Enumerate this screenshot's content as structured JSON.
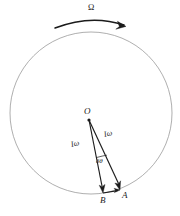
{
  "figure": {
    "background_color": "#ffffff",
    "stroke_color": "#1b1b1b",
    "circle_color": "#9a9a9a",
    "labels": {
      "spin_rate": "Ω",
      "center_point": "O",
      "vector_left": "Iω",
      "vector_right": "Iω",
      "angle": "δθ",
      "point_b": "B",
      "point_a": "A"
    },
    "geometry": {
      "circle": {
        "cx": 91,
        "cy": 113,
        "r": 81
      },
      "origin": {
        "x": 89,
        "y": 120
      },
      "point_b": {
        "x": 103,
        "y": 193
      },
      "point_a": {
        "x": 120,
        "y": 190
      },
      "precession_arc": {
        "x_start": 55,
        "y_start": 28,
        "x_end": 126,
        "y_end": 26,
        "peak_y": 18
      }
    },
    "label_positions": {
      "spin_rate": {
        "x": 88,
        "y": 3
      },
      "center_point": {
        "x": 84,
        "y": 107
      },
      "vector_left": {
        "x": 73,
        "y": 140
      },
      "vector_right": {
        "x": 104,
        "y": 131
      },
      "angle": {
        "x": 96,
        "y": 157
      },
      "point_b": {
        "x": 100,
        "y": 197
      },
      "point_a": {
        "x": 122,
        "y": 192
      }
    }
  }
}
